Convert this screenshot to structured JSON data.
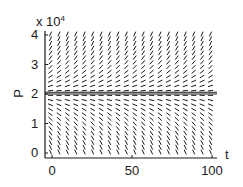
{
  "chart_data": {
    "type": "direction-field",
    "title": "",
    "xlabel": "t",
    "ylabel": "P",
    "y_multiplier_label": "x 10",
    "y_multiplier_exponent": "4",
    "xlim": [
      0,
      100
    ],
    "ylim": [
      0,
      40000
    ],
    "x_ticks": [
      0,
      50,
      100
    ],
    "x_tick_labels": [
      "0",
      "50",
      "100"
    ],
    "y_ticks": [
      0,
      10000,
      20000,
      30000,
      40000
    ],
    "y_tick_labels": [
      "0",
      "1",
      "2",
      "3",
      "4"
    ],
    "equilibrium_lines": [
      20000,
      20600
    ],
    "grid": false,
    "field": {
      "t_columns": 20,
      "p_rows": 26,
      "slope_description": "slopes positive above P=2e4 and negative below, magnitude growing with distance from the equilibrium"
    },
    "colors": {
      "ink": "#1a1a1a",
      "background": "#ffffff"
    }
  }
}
